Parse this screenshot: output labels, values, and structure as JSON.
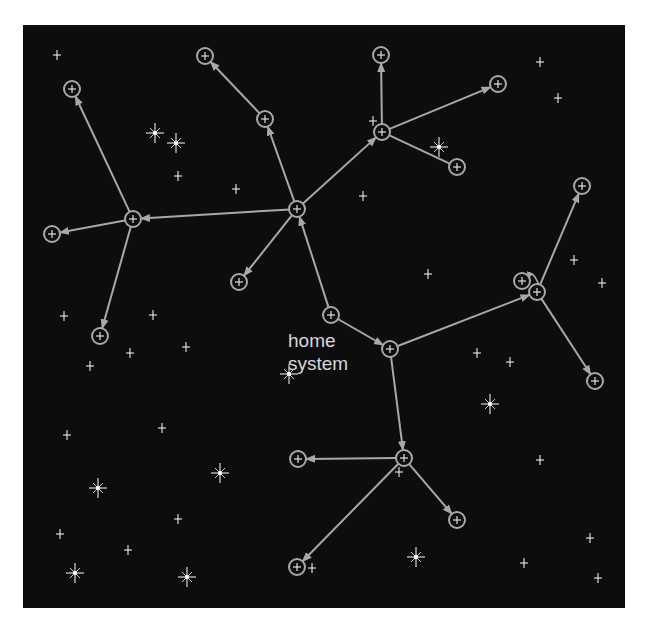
{
  "colors": {
    "background": "#0d0d0d",
    "link": "#a8a8a8",
    "node": "#a8a8a8",
    "star": "#ffffff",
    "label": "#d8d8d8"
  },
  "home_label": {
    "line1": "home",
    "line2": "system"
  },
  "home_node": "n0",
  "nodes": [
    {
      "id": "n0",
      "x": 331,
      "y": 315,
      "role": "home"
    },
    {
      "id": "n1",
      "x": 297,
      "y": 209
    },
    {
      "id": "n2",
      "x": 265,
      "y": 119
    },
    {
      "id": "n3",
      "x": 205,
      "y": 56
    },
    {
      "id": "n4",
      "x": 133,
      "y": 219
    },
    {
      "id": "n5",
      "x": 72,
      "y": 89
    },
    {
      "id": "n6",
      "x": 52,
      "y": 234
    },
    {
      "id": "n7",
      "x": 100,
      "y": 336
    },
    {
      "id": "n8",
      "x": 239,
      "y": 282
    },
    {
      "id": "n9",
      "x": 382,
      "y": 132
    },
    {
      "id": "n10",
      "x": 381,
      "y": 55
    },
    {
      "id": "n11",
      "x": 498,
      "y": 84
    },
    {
      "id": "n12",
      "x": 457,
      "y": 167
    },
    {
      "id": "n13",
      "x": 390,
      "y": 349
    },
    {
      "id": "n14",
      "x": 537,
      "y": 292
    },
    {
      "id": "n15",
      "x": 522,
      "y": 281
    },
    {
      "id": "n16",
      "x": 582,
      "y": 186
    },
    {
      "id": "n17",
      "x": 595,
      "y": 381
    },
    {
      "id": "n18",
      "x": 404,
      "y": 458
    },
    {
      "id": "n19",
      "x": 298,
      "y": 459
    },
    {
      "id": "n20",
      "x": 457,
      "y": 520
    },
    {
      "id": "n21",
      "x": 297,
      "y": 567
    }
  ],
  "links": [
    {
      "from": "n0",
      "to": "n1",
      "arrow": true
    },
    {
      "from": "n0",
      "to": "n13",
      "arrow": true
    },
    {
      "from": "n1",
      "to": "n2",
      "arrow": true
    },
    {
      "from": "n2",
      "to": "n3",
      "arrow": true
    },
    {
      "from": "n1",
      "to": "n4",
      "arrow": true
    },
    {
      "from": "n4",
      "to": "n5",
      "arrow": true
    },
    {
      "from": "n4",
      "to": "n6",
      "arrow": true
    },
    {
      "from": "n4",
      "to": "n7",
      "arrow": true
    },
    {
      "from": "n1",
      "to": "n8",
      "arrow": true
    },
    {
      "from": "n1",
      "to": "n9",
      "arrow": true
    },
    {
      "from": "n9",
      "to": "n10",
      "arrow": true
    },
    {
      "from": "n9",
      "to": "n11",
      "arrow": true
    },
    {
      "from": "n9",
      "to": "n12",
      "arrow": false
    },
    {
      "from": "n13",
      "to": "n14",
      "arrow": true
    },
    {
      "from": "n14",
      "to": "n16",
      "arrow": true
    },
    {
      "from": "n14",
      "to": "n17",
      "arrow": true
    },
    {
      "from": "n14",
      "to": "n15",
      "arrow": true,
      "curved": true
    },
    {
      "from": "n13",
      "to": "n18",
      "arrow": true
    },
    {
      "from": "n18",
      "to": "n19",
      "arrow": true
    },
    {
      "from": "n18",
      "to": "n20",
      "arrow": true
    },
    {
      "from": "n18",
      "to": "n21",
      "arrow": true
    }
  ],
  "small_stars": [
    [
      57,
      55
    ],
    [
      178,
      176
    ],
    [
      236,
      189
    ],
    [
      373,
      121
    ],
    [
      363,
      196
    ],
    [
      540,
      62
    ],
    [
      558,
      98
    ],
    [
      428,
      274
    ],
    [
      574,
      260
    ],
    [
      602,
      283
    ],
    [
      477,
      353
    ],
    [
      510,
      362
    ],
    [
      64,
      316
    ],
    [
      153,
      315
    ],
    [
      130,
      353
    ],
    [
      90,
      366
    ],
    [
      186,
      347
    ],
    [
      67,
      435
    ],
    [
      162,
      428
    ],
    [
      178,
      519
    ],
    [
      60,
      534
    ],
    [
      128,
      550
    ],
    [
      399,
      472
    ],
    [
      312,
      568
    ],
    [
      540,
      460
    ],
    [
      590,
      538
    ],
    [
      524,
      563
    ],
    [
      598,
      578
    ]
  ],
  "bright_stars": [
    [
      155,
      133
    ],
    [
      176,
      143
    ],
    [
      439,
      147
    ],
    [
      289,
      374
    ],
    [
      490,
      404
    ],
    [
      220,
      473
    ],
    [
      98,
      488
    ],
    [
      75,
      573
    ],
    [
      187,
      577
    ],
    [
      416,
      557
    ]
  ]
}
